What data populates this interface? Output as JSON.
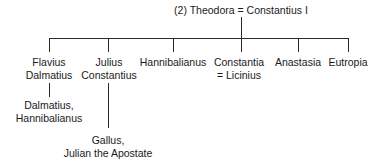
{
  "root": {
    "label": "(2) Theodora = Constantius I"
  },
  "children": [
    {
      "line1": "Flavius",
      "line2": "Dalmatius"
    },
    {
      "line1": "Julius",
      "line2": "Constantius"
    },
    {
      "line1": "Hannibalianus",
      "line2": ""
    },
    {
      "line1": "Constantia",
      "line2": "= Licinius"
    },
    {
      "line1": "Anastasia",
      "line2": ""
    },
    {
      "line1": "Eutropia",
      "line2": ""
    }
  ],
  "grandchildren": [
    {
      "parent": "Flavius Dalmatius",
      "line1": "Dalmatius,",
      "line2": "Hannibalianus"
    },
    {
      "parent": "Julius Constantius",
      "line1": "Gallus,",
      "line2": "Julian the Apostate"
    }
  ]
}
